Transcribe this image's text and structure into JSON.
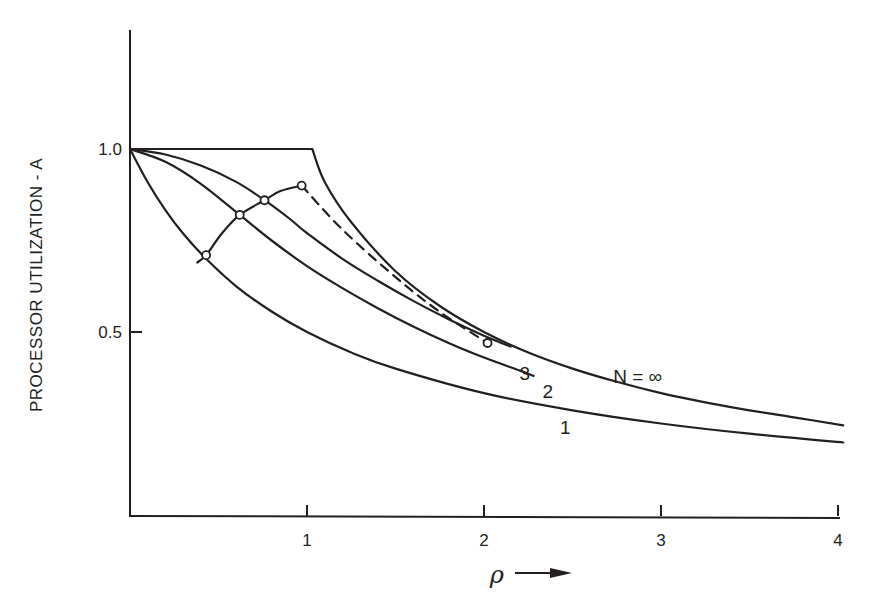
{
  "chart_data": {
    "type": "line",
    "title": "",
    "xlabel": "ρ",
    "xlabel_arrow": "→",
    "ylabel": "PROCESSOR UTILIZATION - A",
    "xlim": [
      0,
      4
    ],
    "ylim": [
      0,
      1.3
    ],
    "grid": false,
    "x_ticks": [
      1,
      2,
      3,
      4
    ],
    "x_tick_labels": [
      "1",
      "2",
      "3",
      "4"
    ],
    "y_ticks": [
      1.0,
      0.5
    ],
    "y_tick_labels": [
      "1.0",
      "0.5"
    ],
    "series": [
      {
        "name": "N=∞",
        "label": "N = ∞",
        "style": "solid",
        "points": [
          [
            0,
            1.0
          ],
          [
            0.5,
            1.0
          ],
          [
            1.0,
            1.0
          ],
          [
            1.1,
            0.91
          ],
          [
            1.25,
            0.8
          ],
          [
            1.5,
            0.666
          ],
          [
            1.75,
            0.571
          ],
          [
            2.0,
            0.5
          ],
          [
            2.25,
            0.444
          ],
          [
            2.5,
            0.4
          ],
          [
            2.75,
            0.364
          ],
          [
            3.0,
            0.333
          ],
          [
            3.25,
            0.308
          ],
          [
            3.5,
            0.286
          ],
          [
            3.75,
            0.267
          ],
          [
            4.03,
            0.245
          ]
        ]
      },
      {
        "name": "N=3",
        "label": "3",
        "style": "solid",
        "points": [
          [
            0,
            1.0
          ],
          [
            0.2,
            0.985
          ],
          [
            0.4,
            0.955
          ],
          [
            0.6,
            0.91
          ],
          [
            0.76,
            0.86
          ],
          [
            0.9,
            0.81
          ],
          [
            1.0,
            0.77
          ],
          [
            1.2,
            0.7
          ],
          [
            1.4,
            0.64
          ],
          [
            1.6,
            0.585
          ],
          [
            1.8,
            0.535
          ],
          [
            2.0,
            0.49
          ],
          [
            2.15,
            0.46
          ]
        ]
      },
      {
        "name": "N=2",
        "label": "2",
        "style": "solid",
        "points": [
          [
            0,
            1.0
          ],
          [
            0.2,
            0.965
          ],
          [
            0.4,
            0.905
          ],
          [
            0.62,
            0.82
          ],
          [
            0.8,
            0.75
          ],
          [
            1.0,
            0.68
          ],
          [
            1.2,
            0.62
          ],
          [
            1.4,
            0.565
          ],
          [
            1.6,
            0.515
          ],
          [
            1.8,
            0.47
          ],
          [
            2.0,
            0.43
          ],
          [
            2.2,
            0.395
          ],
          [
            2.28,
            0.38
          ]
        ]
      },
      {
        "name": "N=1",
        "label": "1",
        "style": "solid",
        "points": [
          [
            0,
            1.0
          ],
          [
            0.1,
            0.909
          ],
          [
            0.2,
            0.833
          ],
          [
            0.3,
            0.769
          ],
          [
            0.43,
            0.7
          ],
          [
            0.6,
            0.625
          ],
          [
            0.8,
            0.556
          ],
          [
            1.0,
            0.5
          ],
          [
            1.25,
            0.444
          ],
          [
            1.5,
            0.4
          ],
          [
            2.0,
            0.333
          ],
          [
            2.5,
            0.286
          ],
          [
            3.0,
            0.25
          ],
          [
            3.5,
            0.222
          ],
          [
            4.03,
            0.198
          ]
        ]
      },
      {
        "name": "optimum-locus",
        "label": "",
        "style": "solid",
        "points": [
          [
            0.38,
            0.69
          ],
          [
            0.43,
            0.71
          ],
          [
            0.52,
            0.77
          ],
          [
            0.62,
            0.82
          ],
          [
            0.76,
            0.86
          ],
          [
            0.85,
            0.885
          ],
          [
            0.97,
            0.9
          ]
        ]
      },
      {
        "name": "optimum-locus-extension",
        "label": "",
        "style": "dashed",
        "points": [
          [
            0.97,
            0.9
          ],
          [
            1.2,
            0.78
          ],
          [
            1.5,
            0.65
          ],
          [
            1.75,
            0.555
          ],
          [
            2.02,
            0.47
          ]
        ]
      }
    ],
    "markers": [
      [
        0.43,
        0.71
      ],
      [
        0.62,
        0.82
      ],
      [
        0.76,
        0.86
      ],
      [
        0.97,
        0.9
      ],
      [
        2.02,
        0.47
      ]
    ]
  }
}
